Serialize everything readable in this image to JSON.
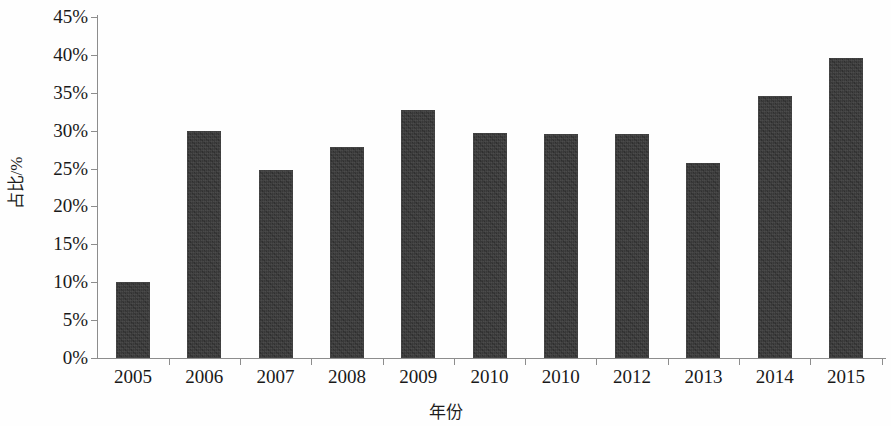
{
  "chart_data": {
    "type": "bar",
    "title": "",
    "subtitle": "",
    "xlabel": "年份",
    "ylabel": "占比/%",
    "categories": [
      "2005",
      "2006",
      "2007",
      "2008",
      "2009",
      "2010",
      "2010",
      "2012",
      "2013",
      "2014",
      "2015"
    ],
    "values": [
      10.0,
      29.9,
      24.8,
      27.8,
      32.7,
      29.7,
      29.6,
      29.6,
      25.7,
      34.6,
      39.6
    ],
    "ylim": [
      0,
      45
    ],
    "ytick_values": [
      0,
      5,
      10,
      15,
      20,
      25,
      30,
      35,
      40,
      45
    ],
    "ytick_labels": [
      "0%",
      "5%",
      "10%",
      "15%",
      "20%",
      "25%",
      "30%",
      "35%",
      "40%",
      "45%"
    ],
    "grid": false,
    "legend": false,
    "legend_position": "none",
    "bar_color": "#383838",
    "axis_color": "#8d8d8d",
    "text_color": "#191919",
    "background_color": "#ffffff",
    "annotations": []
  },
  "axes": {
    "y_title": "占比/%",
    "x_title": "年份"
  }
}
